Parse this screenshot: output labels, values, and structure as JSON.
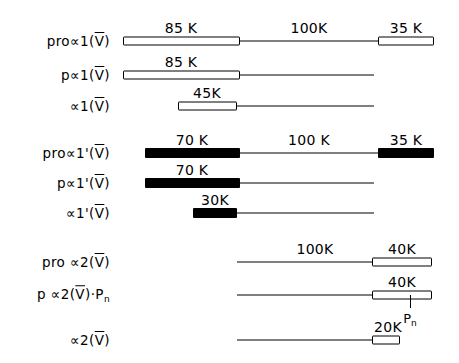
{
  "figure": {
    "unit_suffix": "K",
    "ink_color": "#000000",
    "background_color": "#ffffff",
    "rows": [
      {
        "id": "pro-alpha1-V",
        "label_parts": {
          "prefix": "pro",
          "alpha": "∝",
          "chain": "1",
          "prime": "",
          "type": "V",
          "suffix": ""
        },
        "label_text": "pro∝1(V̅)",
        "y": 41,
        "spine": {
          "x1": 123,
          "x2": 434
        },
        "blocks": [
          {
            "name": "n-propeptide",
            "style": "open",
            "x1": 123,
            "x2": 240,
            "value": "85 K",
            "label_x": 181
          },
          {
            "name": "c-propeptide",
            "style": "open",
            "x1": 378,
            "x2": 434,
            "value": "35 K",
            "label_x": 406
          }
        ],
        "line_values": [
          {
            "value": "100K",
            "label_x": 309
          }
        ]
      },
      {
        "id": "p-alpha1-V",
        "label_parts": {
          "prefix": "p",
          "alpha": "∝",
          "chain": "1",
          "prime": "",
          "type": "V",
          "suffix": ""
        },
        "label_text": "p∝1(V̅)",
        "y": 75,
        "spine": {
          "x1": 123,
          "x2": 374
        },
        "blocks": [
          {
            "name": "n-propeptide",
            "style": "open",
            "x1": 123,
            "x2": 240,
            "value": "85 K",
            "label_x": 181
          }
        ],
        "line_values": []
      },
      {
        "id": "alpha1-V",
        "label_parts": {
          "prefix": "",
          "alpha": "∝",
          "chain": "1",
          "prime": "",
          "type": "V",
          "suffix": ""
        },
        "label_text": "∝1(V̅)",
        "y": 106,
        "spine": {
          "x1": 178,
          "x2": 374
        },
        "blocks": [
          {
            "name": "n-telopeptide",
            "style": "open",
            "x1": 178,
            "x2": 237,
            "value": "45K",
            "label_x": 207
          }
        ],
        "line_values": []
      },
      {
        "id": "pro-alpha1-prime-V",
        "label_parts": {
          "prefix": "pro",
          "alpha": "∝",
          "chain": "1",
          "prime": "'",
          "type": "V",
          "suffix": ""
        },
        "label_text": "pro∝1'(V̅)",
        "y": 153,
        "spine": {
          "x1": 145,
          "x2": 434
        },
        "blocks": [
          {
            "name": "n-propeptide",
            "style": "solid",
            "x1": 145,
            "x2": 240,
            "value": "70 K",
            "label_x": 192
          },
          {
            "name": "c-propeptide",
            "style": "solid",
            "x1": 378,
            "x2": 434,
            "value": "35 K",
            "label_x": 406
          }
        ],
        "line_values": [
          {
            "value": "100 K",
            "label_x": 309
          }
        ]
      },
      {
        "id": "p-alpha1-prime-V",
        "label_parts": {
          "prefix": "p",
          "alpha": "∝",
          "chain": "1",
          "prime": "'",
          "type": "V",
          "suffix": ""
        },
        "label_text": "p∝1'(V̅)",
        "y": 183,
        "spine": {
          "x1": 145,
          "x2": 374
        },
        "blocks": [
          {
            "name": "n-propeptide",
            "style": "solid",
            "x1": 145,
            "x2": 240,
            "value": "70 K",
            "label_x": 192
          }
        ],
        "line_values": []
      },
      {
        "id": "alpha1-prime-V",
        "label_parts": {
          "prefix": "",
          "alpha": "∝",
          "chain": "1",
          "prime": "'",
          "type": "V",
          "suffix": ""
        },
        "label_text": "∝1'(V̅)",
        "y": 213,
        "spine": {
          "x1": 193,
          "x2": 374
        },
        "blocks": [
          {
            "name": "n-telopeptide",
            "style": "solid",
            "x1": 193,
            "x2": 237,
            "value": "30K",
            "label_x": 215
          }
        ],
        "line_values": []
      },
      {
        "id": "pro-alpha2-V",
        "label_parts": {
          "prefix": "pro ",
          "alpha": "∝",
          "chain": "2",
          "prime": "",
          "type": "V",
          "suffix": ""
        },
        "label_text": "pro ∝2(V̅)",
        "y": 262,
        "spine": {
          "x1": 237,
          "x2": 432
        },
        "blocks": [
          {
            "name": "c-propeptide",
            "style": "open",
            "x1": 372,
            "x2": 432,
            "value": "40K",
            "label_x": 402
          }
        ],
        "line_values": [
          {
            "value": "100K",
            "label_x": 315
          }
        ]
      },
      {
        "id": "p-alpha2-V-Pn",
        "label_parts": {
          "prefix": "p ",
          "alpha": "∝",
          "chain": "2",
          "prime": "",
          "type": "V",
          "suffix": "·P"
        },
        "label_text": "p ∝2(V̅)·Pₙ",
        "y": 295,
        "spine": {
          "x1": 237,
          "x2": 432
        },
        "blocks": [
          {
            "name": "c-propeptide",
            "style": "open",
            "x1": 372,
            "x2": 432,
            "value": "40K",
            "label_x": 402
          }
        ],
        "line_values": [],
        "annotation": {
          "name": "pn-marker",
          "text": "P",
          "subscript": "n",
          "x": 410,
          "tick_top": 295,
          "tick_height": 13,
          "text_y": 311
        }
      },
      {
        "id": "alpha2-V",
        "label_parts": {
          "prefix": "",
          "alpha": "∝",
          "chain": "2",
          "prime": "",
          "type": "V",
          "suffix": ""
        },
        "label_text": "∝2(V̅)",
        "y": 340,
        "spine": {
          "x1": 237,
          "x2": 400
        },
        "blocks": [
          {
            "name": "c-telopeptide",
            "style": "open",
            "x1": 372,
            "x2": 400,
            "value": "20K",
            "label_x": 388
          }
        ],
        "line_values": []
      }
    ]
  }
}
